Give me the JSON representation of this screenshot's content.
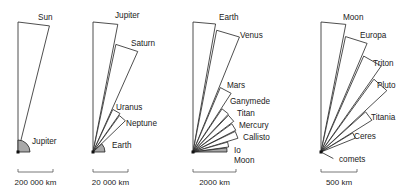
{
  "panels": [
    {
      "scale_label": "200 000 km",
      "origin": [
        18,
        152
      ],
      "bodies": [
        {
          "name": "Sun",
          "len": 130,
          "a0": 90,
          "a1": 76,
          "grey": false,
          "label_xy": [
            38,
            20
          ]
        },
        {
          "name": "Jupiter",
          "len": 12,
          "a0": 90,
          "a1": 0,
          "grey": true,
          "label_xy": [
            32,
            144
          ]
        }
      ],
      "scale_bar": [
        18,
        53
      ]
    },
    {
      "scale_label": "20 000 km",
      "origin": [
        93,
        152
      ],
      "bodies": [
        {
          "name": "Jupiter",
          "len": 130,
          "a0": 90,
          "a1": 79,
          "grey": false,
          "label_xy": [
            115,
            18
          ]
        },
        {
          "name": "Saturn",
          "len": 110,
          "a0": 78,
          "a1": 66,
          "grey": false,
          "label_xy": [
            131,
            46
          ]
        },
        {
          "name": "Uranus",
          "len": 47,
          "a0": 65,
          "a1": 55,
          "grey": false,
          "label_xy": [
            116,
            110
          ]
        },
        {
          "name": "Neptune",
          "len": 45,
          "a0": 54,
          "a1": 44,
          "grey": false,
          "label_xy": [
            126,
            126
          ]
        },
        {
          "name": "Earth",
          "len": 12,
          "a0": 43,
          "a1": 0,
          "grey": true,
          "label_xy": [
            112,
            148
          ]
        }
      ],
      "scale_bar": [
        93,
        128
      ]
    },
    {
      "scale_label": "2000 km",
      "origin": [
        193,
        152
      ],
      "bodies": [
        {
          "name": "Earth",
          "len": 130,
          "a0": 90,
          "a1": 80,
          "grey": false,
          "label_xy": [
            219,
            20
          ]
        },
        {
          "name": "Venus",
          "len": 124,
          "a0": 79,
          "a1": 68,
          "grey": false,
          "label_xy": [
            240,
            38
          ]
        },
        {
          "name": "Mars",
          "len": 70,
          "a0": 67,
          "a1": 57,
          "grey": false,
          "label_xy": [
            227,
            88
          ]
        },
        {
          "name": "Ganymede",
          "len": 52,
          "a0": 56,
          "a1": 47,
          "grey": false,
          "label_xy": [
            230,
            104
          ]
        },
        {
          "name": "Titan",
          "len": 51,
          "a0": 46,
          "a1": 37,
          "grey": false,
          "label_xy": [
            237,
            116
          ]
        },
        {
          "name": "Mercury",
          "len": 48,
          "a0": 36,
          "a1": 27,
          "grey": false,
          "label_xy": [
            239,
            128
          ]
        },
        {
          "name": "Callisto",
          "len": 47,
          "a0": 26,
          "a1": 17,
          "grey": false,
          "label_xy": [
            243,
            140
          ]
        },
        {
          "name": "Io",
          "len": 36,
          "a0": 16,
          "a1": 8,
          "grey": false,
          "label_xy": [
            234,
            153
          ]
        },
        {
          "name": "Moon",
          "len": 34,
          "a0": 7,
          "a1": 0,
          "grey": true,
          "label_xy": [
            234,
            163
          ]
        }
      ],
      "scale_bar": [
        193,
        236
      ]
    },
    {
      "scale_label": "500 km",
      "origin": [
        321,
        152
      ],
      "bodies": [
        {
          "name": "Moon",
          "len": 130,
          "a0": 90,
          "a1": 79,
          "grey": false,
          "label_xy": [
            343,
            20
          ]
        },
        {
          "name": "Europa",
          "len": 118,
          "a0": 78,
          "a1": 67,
          "grey": false,
          "label_xy": [
            360,
            38
          ]
        },
        {
          "name": "Triton",
          "len": 105,
          "a0": 66,
          "a1": 55,
          "grey": false,
          "label_xy": [
            373,
            66
          ]
        },
        {
          "name": "Pluto",
          "len": 90,
          "a0": 54,
          "a1": 43,
          "grey": false,
          "label_xy": [
            377,
            88
          ]
        },
        {
          "name": "Titania",
          "len": 60,
          "a0": 42,
          "a1": 32,
          "grey": false,
          "label_xy": [
            371,
            120
          ]
        },
        {
          "name": "Ceres",
          "len": 37,
          "a0": 31,
          "a1": 22,
          "grey": false,
          "label_xy": [
            354,
            139
          ]
        },
        {
          "name": "comets",
          "len": 10,
          "a0": -10,
          "a1": -30,
          "grey": false,
          "label_xy": [
            339,
            162
          ]
        }
      ],
      "scale_bar": [
        321,
        357
      ]
    }
  ]
}
